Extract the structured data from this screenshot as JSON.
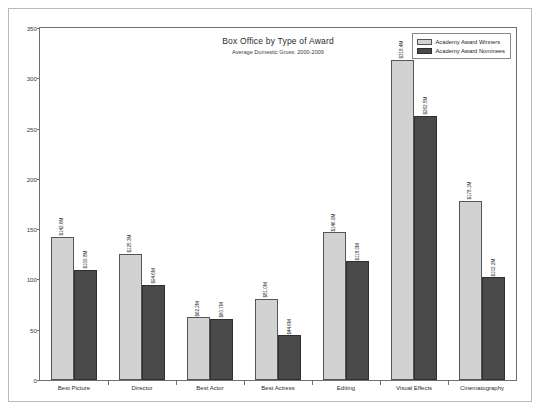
{
  "chart_data": {
    "type": "bar",
    "title": "Box Office by Type of Award",
    "subtitle": "Average Domestic Gross: 2000-2009",
    "xlabel": "",
    "ylabel": "",
    "ylim": [
      0,
      350
    ],
    "yticks": [
      0,
      50,
      100,
      150,
      200,
      250,
      300,
      350
    ],
    "grid": false,
    "legend_position": "top-right",
    "categories": [
      "Best Picture",
      "Director",
      "Best Actor",
      "Best Actress",
      "Editing",
      "Visual Effects",
      "Cinematography"
    ],
    "series": [
      {
        "name": "Academy Award Winners",
        "color": "#d2d2d2",
        "values": [
          142.6,
          125.3,
          62.2,
          81.0,
          146.9,
          318.4,
          178.1
        ],
        "labels": [
          "$142.6M",
          "$125.3M",
          "$62.2M",
          "$81.0M",
          "$146.9M",
          "$318.4M",
          "$178.1M"
        ]
      },
      {
        "name": "Academy Award Nominees",
        "color": "#4a4a4a",
        "values": [
          109.8,
          94.6,
          60.7,
          44.6,
          118.0,
          262.5,
          102.2
        ],
        "labels": [
          "$109.8M",
          "$94.6M",
          "$60.7M",
          "$44.6M",
          "$118.0M",
          "$262.5M",
          "$102.2M"
        ]
      }
    ]
  },
  "legend": {
    "items": [
      {
        "label": "Academy Award Winners"
      },
      {
        "label": "Academy Award Nominees"
      }
    ]
  }
}
